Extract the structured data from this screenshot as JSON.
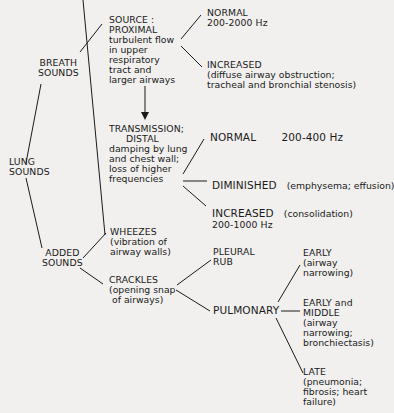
{
  "diagram": {
    "root": {
      "label_line1": "LUNG",
      "label_line2": "SOUNDS"
    },
    "breath_sounds": {
      "label_line1": "BREATH",
      "label_line2": "SOUNDS",
      "source": {
        "title1": "SOURCE :",
        "title2": "PROXIMAL",
        "desc": [
          "turbulent flow",
          "in upper",
          "respiratory",
          "tract and",
          "larger airways"
        ],
        "children": {
          "normal": {
            "title": "NORMAL",
            "detail": "200-2000 Hz"
          },
          "increased": {
            "title": "INCREASED",
            "detail": [
              "(diffuse airway obstruction;",
              "tracheal and bronchial stenosis)"
            ]
          }
        }
      },
      "transmission": {
        "title1": "TRANSMISSION;",
        "title2": "DISTAL",
        "desc": [
          "damping by lung",
          "and chest wall;",
          "loss of higher",
          "frequencies"
        ],
        "children": {
          "normal": {
            "title": "NORMAL",
            "detail": "200-400 Hz"
          },
          "diminished": {
            "title": "DIMINISHED",
            "detail": "(emphysema; effusion)"
          },
          "increased": {
            "title": "INCREASED",
            "detail": "(consolidation)",
            "range": "200-1000 Hz"
          }
        }
      }
    },
    "added_sounds": {
      "label_line1": "ADDED",
      "label_line2": "SOUNDS",
      "wheezes": {
        "title": "WHEEZES",
        "desc": [
          "(vibration of",
          "airway walls)"
        ]
      },
      "crackles": {
        "title": "CRACKLES",
        "desc": [
          "(opening snap",
          "of airways)"
        ],
        "pleural_rub": {
          "line1": "PLEURAL",
          "line2": "RUB"
        },
        "pulmonary": {
          "title": "PULMONARY",
          "early": {
            "title": "EARLY",
            "desc": [
              "(airway",
              "narrowing)"
            ]
          },
          "early_middle": {
            "title1": "EARLY and",
            "title2": "MIDDLE",
            "desc": [
              "(airway",
              "narrowing;",
              "bronchiectasis)"
            ]
          },
          "late": {
            "title": "LATE",
            "desc": [
              "(pneumonia;",
              "fibrosis; heart",
              "failure)"
            ]
          }
        }
      }
    }
  },
  "colors": {
    "background": "#f1f0ee",
    "ink": "#1a1a1a"
  }
}
